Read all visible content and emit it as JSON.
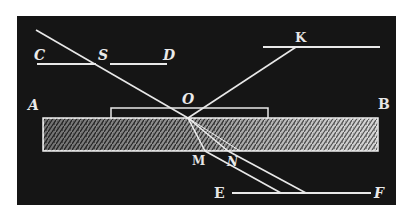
{
  "figure": {
    "colors": {
      "background": "#151515",
      "line": "#e8e8e8",
      "slab_light": "#d8d8d8",
      "slab_dark": "#3a3a3a",
      "page": "#ffffff"
    },
    "labels": {
      "C": "C",
      "S": "S",
      "D": "D",
      "K": "K",
      "A": "A",
      "B": "B",
      "O": "O",
      "M": "M",
      "N": "N",
      "E": "E",
      "F": "F"
    }
  }
}
